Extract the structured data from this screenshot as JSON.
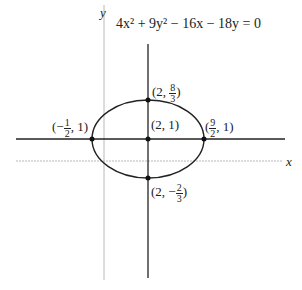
{
  "equation": "4x² + 9y² − 16x − 18y = 0",
  "axes": {
    "x_label": "x",
    "y_label": "y"
  },
  "points": {
    "center": {
      "label": "(2, 1)"
    },
    "top": {
      "prefix": "(2, ",
      "num": "8",
      "den": "3",
      "suffix": ")"
    },
    "bottom": {
      "prefix": "(2, −",
      "num": "2",
      "den": "3",
      "suffix": ")"
    },
    "left": {
      "prefix": "(−",
      "num": "1",
      "den": "2",
      "suffix": ", 1)"
    },
    "right": {
      "prefix": "(",
      "num": "9",
      "den": "2",
      "suffix": ", 1)"
    }
  },
  "colors": {
    "curve": "#222222",
    "axis": "#b0b0b0"
  }
}
